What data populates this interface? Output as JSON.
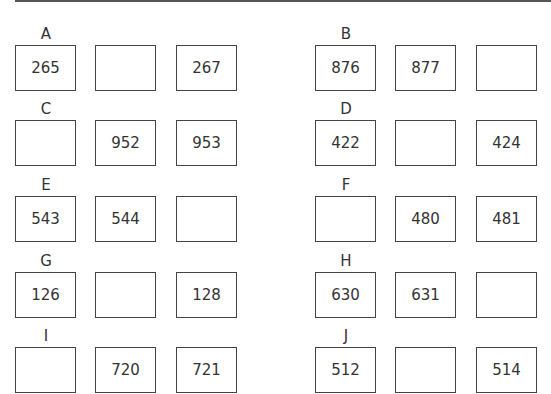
{
  "worksheet": {
    "problems": [
      {
        "label": "A",
        "boxes": [
          "265",
          "",
          "267"
        ]
      },
      {
        "label": "B",
        "boxes": [
          "876",
          "877",
          ""
        ]
      },
      {
        "label": "C",
        "boxes": [
          "",
          "952",
          "953"
        ]
      },
      {
        "label": "D",
        "boxes": [
          "422",
          "",
          "424"
        ]
      },
      {
        "label": "E",
        "boxes": [
          "543",
          "544",
          ""
        ]
      },
      {
        "label": "F",
        "boxes": [
          "",
          "480",
          "481"
        ]
      },
      {
        "label": "G",
        "boxes": [
          "126",
          "",
          "128"
        ]
      },
      {
        "label": "H",
        "boxes": [
          "630",
          "631",
          ""
        ]
      },
      {
        "label": "I",
        "boxes": [
          "",
          "720",
          "721"
        ]
      },
      {
        "label": "J",
        "boxes": [
          "512",
          "",
          "514"
        ]
      }
    ]
  }
}
